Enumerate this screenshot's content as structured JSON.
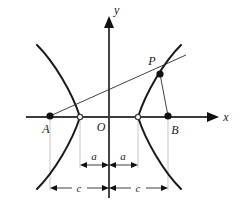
{
  "figure": {
    "axes": {
      "x_label": "x",
      "y_label": "y",
      "origin_label": "O",
      "x_axis_y": 117,
      "y_axis_x": 109
    },
    "points": [
      {
        "id": "A",
        "label": "A",
        "x": 50,
        "y": 116,
        "style": "filled",
        "role": "left-focus"
      },
      {
        "id": "V1",
        "label": "",
        "x": 80,
        "y": 117,
        "style": "open",
        "role": "left-vertex"
      },
      {
        "id": "O",
        "label": "O",
        "x": 109,
        "y": 117,
        "style": "none",
        "role": "origin"
      },
      {
        "id": "V2",
        "label": "",
        "x": 138,
        "y": 117,
        "style": "open",
        "role": "right-vertex"
      },
      {
        "id": "B",
        "label": "B",
        "x": 168,
        "y": 116,
        "style": "filled",
        "role": "right-focus"
      },
      {
        "id": "P",
        "label": "P",
        "x": 160,
        "y": 74,
        "style": "filled",
        "role": "point-on-curve"
      }
    ],
    "dimensions": [
      {
        "id": "a-left",
        "label": "a",
        "from_x": 80,
        "to_x": 109,
        "y": 165,
        "label_pos": "above"
      },
      {
        "id": "a-right",
        "label": "a",
        "from_x": 109,
        "to_x": 138,
        "y": 165,
        "label_pos": "above"
      },
      {
        "id": "c-left",
        "label": "c",
        "from_x": 50,
        "to_x": 109,
        "y": 188,
        "label_pos": "inline"
      },
      {
        "id": "c-right",
        "label": "c",
        "from_x": 109,
        "to_x": 168,
        "y": 188,
        "label_pos": "inline"
      }
    ],
    "segments": [
      {
        "id": "AP",
        "from": "A",
        "to": "P",
        "extended": true
      },
      {
        "id": "PB",
        "from": "P",
        "to": "B",
        "extended": false
      }
    ],
    "colors": {
      "curve": "#1a1a1a",
      "axis": "#3b3b3b",
      "guide": "#b9b9b9",
      "dim": "#2b2b2b",
      "background": "#ffffff"
    }
  }
}
